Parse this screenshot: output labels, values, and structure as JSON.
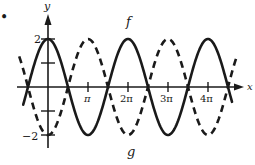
{
  "chart_data": {
    "type": "line",
    "title": "",
    "xlabel": "x",
    "ylabel": "y",
    "x_ticks": [
      {
        "value": 3.14159,
        "label": "π"
      },
      {
        "value": 6.28319,
        "label": "2π"
      },
      {
        "value": 9.42478,
        "label": "3π"
      },
      {
        "value": 12.56637,
        "label": "4π"
      }
    ],
    "y_ticks": [
      {
        "value": 2,
        "label": "2"
      },
      {
        "value": 1,
        "label": ""
      },
      {
        "value": -1,
        "label": ""
      },
      {
        "value": -2,
        "label": "−2"
      }
    ],
    "xlim": [
      -1.9,
      14.2
    ],
    "ylim": [
      -2,
      2
    ],
    "grid": false,
    "legend": "none (curves labeled inline)",
    "series": [
      {
        "name": "f",
        "expression": "2cos(x)",
        "style": "solid",
        "label": "f",
        "amplitude": 2,
        "period": "2π"
      },
      {
        "name": "g",
        "expression": "-2cos(x)",
        "style": "dashed",
        "label": "g",
        "amplitude": 2,
        "period": "2π"
      }
    ],
    "annotations": [
      {
        "text": "f",
        "near": "peak at x=2π"
      },
      {
        "text": "g",
        "near": "trough at x=2π"
      },
      {
        "text": "•",
        "position": "top-left bullet"
      }
    ]
  },
  "labels": {
    "y_axis": "y",
    "x_axis": "x",
    "y_top": "2",
    "y_bottom": "−2",
    "tick_pi": "π",
    "tick_2pi": "2π",
    "tick_3pi": "3π",
    "tick_4pi": "4π",
    "curve_f": "f",
    "curve_g": "g",
    "bullet": "•"
  },
  "colors": {
    "ink": "#1a1a1a",
    "background": "#ffffff"
  }
}
